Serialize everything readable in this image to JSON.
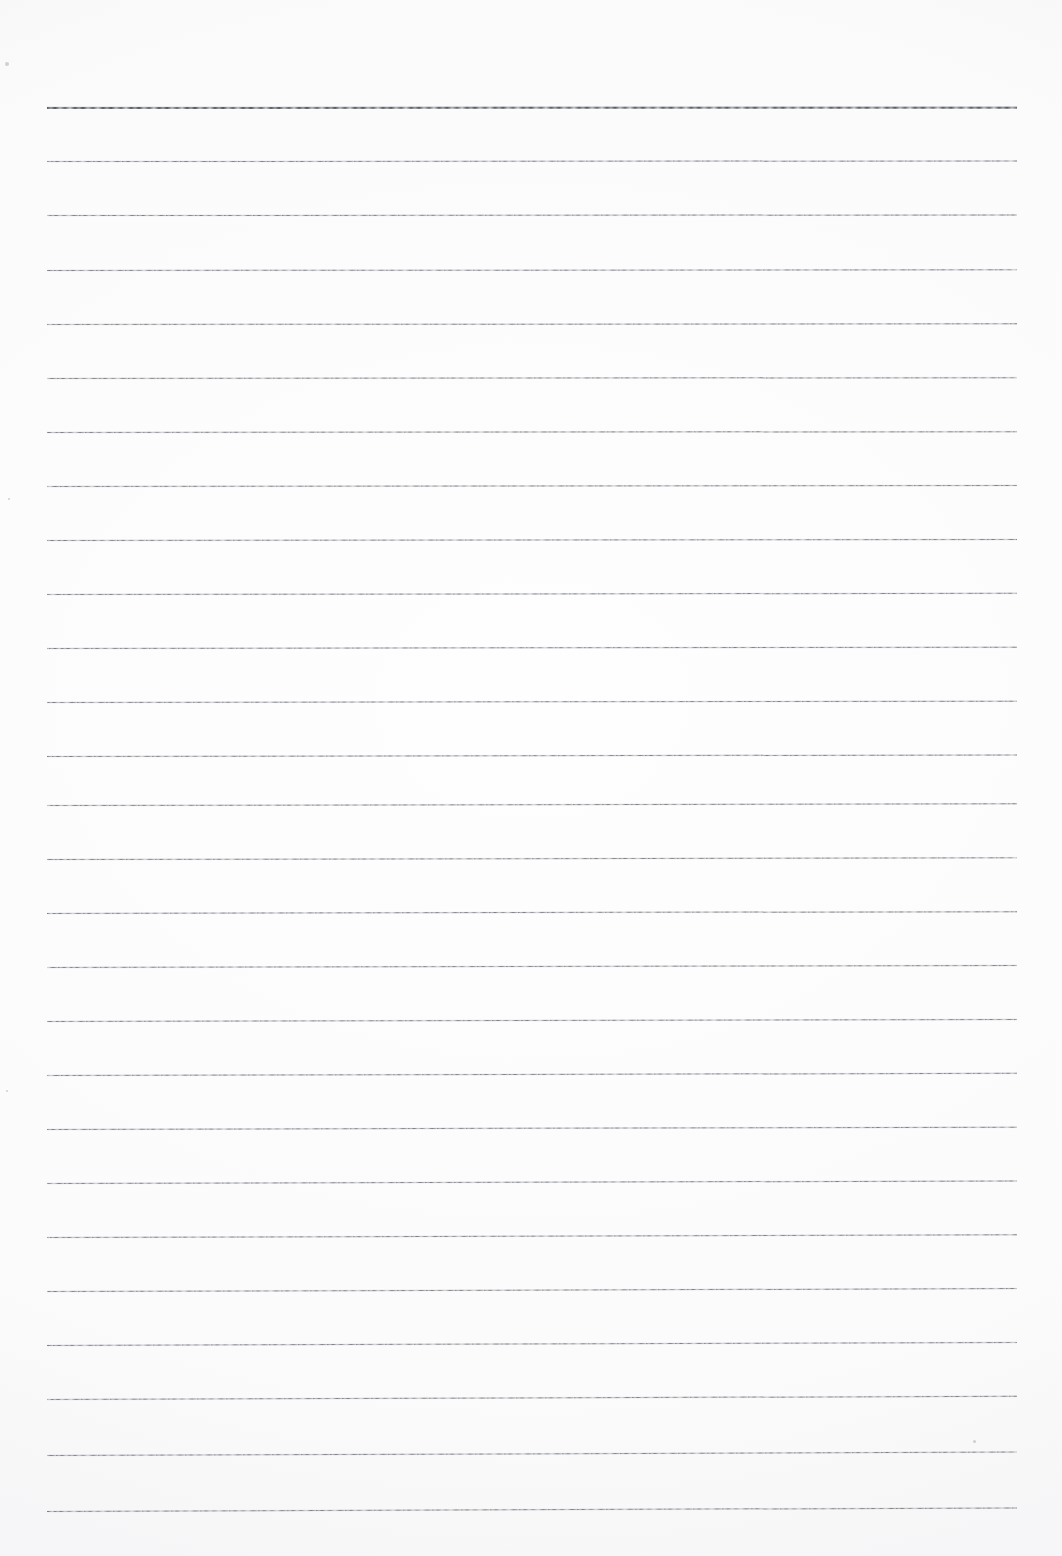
{
  "document": {
    "kind": "scanned-lined-paper",
    "page_width": 1062,
    "page_height": 1556,
    "background_color": "#fefefe",
    "text_content": "",
    "notes": "Blank ruled notebook page scan. No text, headings, numbers, labels or UI controls are present in the pixels."
  },
  "ruling": {
    "line_color": "#767980",
    "heavy_line_color": "#585b63",
    "line_count": 27,
    "first_line_y": 107,
    "line_spacing": 54,
    "line_left_x": 47,
    "line_right_x": 1017,
    "line_thickness": 1,
    "heavy_line_indices": [
      0
    ],
    "tilt_degrees_by_line": [
      0.02,
      0.03,
      0.03,
      0.04,
      0.04,
      0.05,
      0.05,
      0.06,
      0.06,
      0.07,
      0.08,
      0.08,
      0.09,
      0.1,
      0.1,
      0.11,
      0.12,
      0.12,
      0.13,
      0.14,
      0.15,
      0.16,
      0.17,
      0.18,
      0.19,
      0.2,
      0.21
    ],
    "lines_y": [
      107,
      161,
      215,
      270,
      324,
      378,
      432,
      486,
      540,
      594,
      648,
      702,
      756,
      805,
      859,
      913,
      967,
      1021,
      1075,
      1129,
      1183,
      1237,
      1291,
      1345,
      1399,
      1455,
      1511
    ]
  },
  "artifacts": {
    "specks": [
      {
        "x": 5,
        "y": 62,
        "size": 4
      },
      {
        "x": 973,
        "y": 1440,
        "size": 3
      },
      {
        "x": 8,
        "y": 498,
        "size": 2
      },
      {
        "x": 6,
        "y": 1090,
        "size": 2
      }
    ]
  }
}
